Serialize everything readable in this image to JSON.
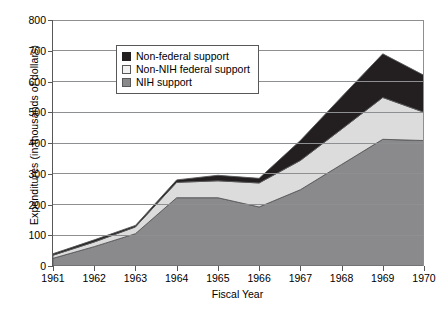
{
  "chart_data": {
    "type": "area",
    "stacked": true,
    "title": "",
    "xlabel": "Fiscal Year",
    "ylabel": "Expenditures (in thousands of dollars)",
    "categories": [
      1961,
      1962,
      1963,
      1964,
      1965,
      1966,
      1967,
      1968,
      1969,
      1970
    ],
    "xlim": [
      1961,
      1970
    ],
    "ylim": [
      0,
      800
    ],
    "yticks": [
      0,
      100,
      200,
      300,
      400,
      500,
      600,
      700,
      800
    ],
    "ytick_labels": [
      "0",
      "100",
      "200",
      "300",
      "400",
      "500",
      "600",
      "700",
      "800"
    ],
    "xtick_labels": [
      "1961",
      "1962",
      "1963",
      "1964",
      "1965",
      "1966",
      "1967",
      "1968",
      "1969",
      "1970"
    ],
    "grid": "horizontal",
    "legend_position": "top-left",
    "series": [
      {
        "name": "NIH support",
        "color": "#8a8a8c",
        "values": [
          25,
          63,
          105,
          222,
          222,
          192,
          248,
          330,
          412,
          408
        ]
      },
      {
        "name": "Non-NIH federal support",
        "color": "#dcdcdc",
        "values": [
          10,
          15,
          22,
          50,
          55,
          78,
          95,
          115,
          136,
          92
        ]
      },
      {
        "name": "Non-federal support",
        "color": "#231f20",
        "values": [
          5,
          7,
          5,
          8,
          18,
          15,
          65,
          105,
          142,
          120
        ]
      }
    ],
    "cumulative_totals": [
      40,
      85,
      132,
      280,
      295,
      285,
      408,
      550,
      690,
      620
    ],
    "legend_entries": [
      {
        "label": "Non-federal support",
        "swatch_color": "#231f20",
        "swatch_border": "#231f20"
      },
      {
        "label": "Non-NIH federal support",
        "swatch_color": "#f2f2f2",
        "swatch_border": "#58585a"
      },
      {
        "label": "NIH support",
        "swatch_color": "#8a8a8c",
        "swatch_border": "#58585a"
      }
    ]
  },
  "colors": {
    "axis": "#58585a",
    "grid": "#8e8f91",
    "background": "#ffffff"
  }
}
